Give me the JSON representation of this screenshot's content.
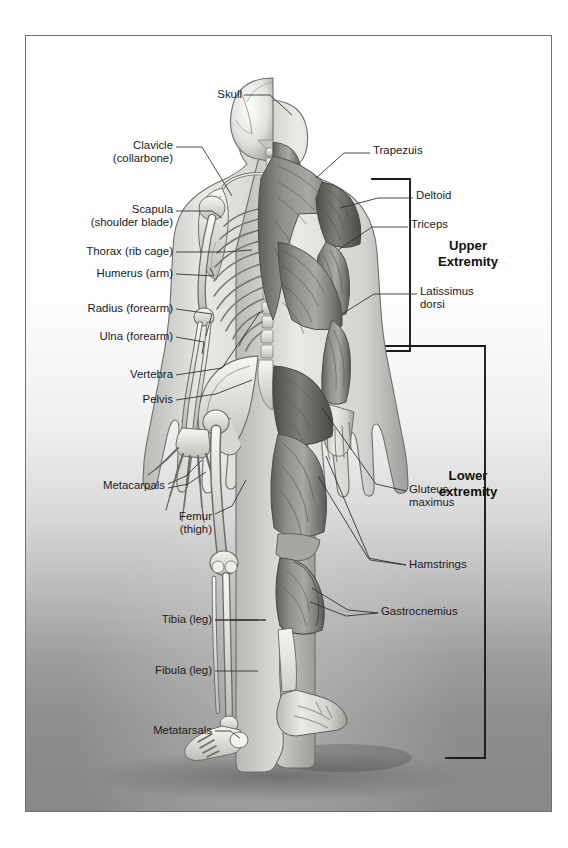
{
  "figure": {
    "view": "posterior",
    "left_half": "skeleton",
    "right_half": "musculature",
    "frame_color": "#6f6f6f",
    "text_color": "#1b1b1b"
  },
  "skeletal_labels": [
    {
      "id": "skull",
      "text": "Skull",
      "x": 216,
      "y": 62,
      "align": "right"
    },
    {
      "id": "clavicle",
      "text": "Clavicle\n(collarbone)",
      "x": 147,
      "y": 113,
      "align": "right"
    },
    {
      "id": "scapula",
      "text": "Scapula\n(shoulder blade)",
      "x": 147,
      "y": 177,
      "align": "right"
    },
    {
      "id": "thorax",
      "text": "Thorax (rib cage)",
      "x": 147,
      "y": 218,
      "align": "right"
    },
    {
      "id": "humerus",
      "text": "Humerus (arm)",
      "x": 147,
      "y": 240,
      "align": "right"
    },
    {
      "id": "radius",
      "text": "Radius (forearm)",
      "x": 147,
      "y": 275,
      "align": "right"
    },
    {
      "id": "ulna",
      "text": "Ulna (forearm)",
      "x": 147,
      "y": 303,
      "align": "right"
    },
    {
      "id": "vertebra",
      "text": "Vertebra",
      "x": 147,
      "y": 341,
      "align": "right"
    },
    {
      "id": "pelvis",
      "text": "Pelvis",
      "x": 147,
      "y": 366,
      "align": "right"
    },
    {
      "id": "metacarpals",
      "text": "Metacarpals",
      "x": 139,
      "y": 453,
      "align": "right"
    },
    {
      "id": "femur",
      "text": "Femur\n(thigh)",
      "x": 186,
      "y": 485,
      "align": "right"
    },
    {
      "id": "tibia",
      "text": "Tibia (leg)",
      "x": 186,
      "y": 586,
      "align": "right"
    },
    {
      "id": "fibula",
      "text": "Fibula (leg)",
      "x": 186,
      "y": 637,
      "align": "right"
    },
    {
      "id": "metatarsals",
      "text": "Metatarsals",
      "x": 186,
      "y": 697,
      "align": "right"
    }
  ],
  "muscular_labels": [
    {
      "id": "trapezuis",
      "text": "Trapezuis",
      "x": 347,
      "y": 117,
      "align": "left"
    },
    {
      "id": "deltoid",
      "text": "Deltoid",
      "x": 390,
      "y": 162,
      "align": "left"
    },
    {
      "id": "triceps",
      "text": "Triceps",
      "x": 385,
      "y": 191,
      "align": "left"
    },
    {
      "id": "latissimus-dorsi",
      "text": "Latissimus\ndorsi",
      "x": 394,
      "y": 257,
      "align": "left"
    },
    {
      "id": "gluteus-maximus",
      "text": "Gluteus\nmaximus",
      "x": 383,
      "y": 457,
      "align": "left"
    },
    {
      "id": "hamstrings",
      "text": "Hamstrings",
      "x": 383,
      "y": 531,
      "align": "left"
    },
    {
      "id": "gastrocnemius",
      "text": "Gastrocnemius",
      "x": 355,
      "y": 578,
      "align": "left"
    }
  ],
  "region_brackets": [
    {
      "id": "upper-extremity",
      "text": "Upper\nExtremity",
      "text_x": 437,
      "text_y": 210
    },
    {
      "id": "lower-extremity",
      "text": "Lower\nextremity",
      "text_x": 437,
      "text_y": 440
    }
  ]
}
